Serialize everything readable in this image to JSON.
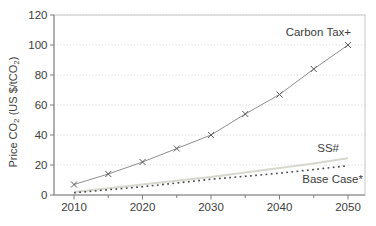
{
  "chart_data": {
    "type": "line",
    "title": "",
    "xlabel": "",
    "ylabel": "Price CO₂ (US $/tCO₂)",
    "x": [
      2010,
      2015,
      2020,
      2025,
      2030,
      2035,
      2040,
      2045,
      2050
    ],
    "x_major_ticks": [
      2010,
      2020,
      2030,
      2040,
      2050
    ],
    "x_minor_ticks": [
      2015,
      2025,
      2035,
      2045
    ],
    "y_ticks": [
      0,
      20,
      40,
      60,
      80,
      100,
      120
    ],
    "xlim": [
      2007,
      2052.5
    ],
    "ylim": [
      0,
      120
    ],
    "grid": "horizontal-dotted",
    "legend_position": "inline-labels",
    "colors": {
      "background": "#ffffff",
      "axis": "#7f7f7f",
      "border": "#c6c6c6",
      "grid": "#d6d6d6",
      "text": "#3d3d3d"
    },
    "series": [
      {
        "name": "Carbon Tax+",
        "values": [
          7,
          14,
          22,
          31,
          40,
          54,
          67,
          84,
          100
        ],
        "style": "solid",
        "marker": "x",
        "color": "#8f8f8f",
        "marker_color": "#595959",
        "stroke_width": 1,
        "dash": ""
      },
      {
        "name": "SS#",
        "values": [
          2,
          4.5,
          7,
          9.5,
          12,
          15,
          18,
          21,
          24.5
        ],
        "style": "solid",
        "marker": "none",
        "color": "#d8d7cf",
        "marker_color": "",
        "stroke_width": 1.8,
        "dash": ""
      },
      {
        "name": "Base Case*",
        "values": [
          1.5,
          3.5,
          5.5,
          8,
          10.5,
          12.5,
          14.5,
          17,
          19.5
        ],
        "style": "dotted",
        "marker": "none",
        "color": "#4a4a4a",
        "marker_color": "",
        "stroke_width": 1.6,
        "dash": "1.8 3.4"
      }
    ]
  }
}
